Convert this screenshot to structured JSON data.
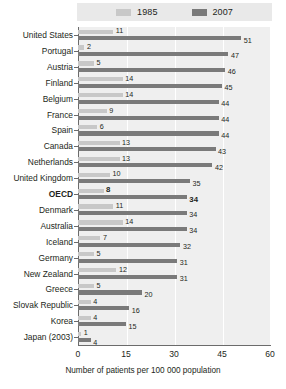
{
  "chart_data": {
    "type": "bar",
    "orientation": "horizontal",
    "title": "",
    "xlabel": "Number of patients per 100 000 population",
    "ylabel": "",
    "xlim": [
      0,
      60
    ],
    "xticks": [
      0,
      15,
      30,
      45,
      60
    ],
    "grid": true,
    "legend_position": "top",
    "categories": [
      "United States",
      "Portugal",
      "Austria",
      "Finland",
      "Belgium",
      "France",
      "Spain",
      "Canada",
      "Netherlands",
      "United Kingdom",
      "OECD",
      "Denmark",
      "Australia",
      "Iceland",
      "Germany",
      "New Zealand",
      "Greece",
      "Slovak Republic",
      "Korea",
      "Japan (2003)"
    ],
    "highlight_category": "OECD",
    "series": [
      {
        "name": "1985",
        "color": "#c8c8c8",
        "values": [
          11,
          2,
          5,
          14,
          14,
          9,
          6,
          13,
          13,
          10,
          8,
          11,
          14,
          7,
          5,
          12,
          5,
          4,
          4,
          1
        ]
      },
      {
        "name": "2007",
        "color": "#7a7a7a",
        "values": [
          51,
          47,
          46,
          45,
          44,
          44,
          44,
          43,
          42,
          35,
          34,
          34,
          34,
          32,
          31,
          31,
          20,
          16,
          15,
          4
        ]
      }
    ]
  },
  "legend": {
    "entries": [
      {
        "label": "1985"
      },
      {
        "label": "2007"
      }
    ]
  },
  "axis": {
    "tick_labels": [
      "0",
      "15",
      "30",
      "45",
      "60"
    ],
    "caption": "Number of patients per 100 000 population"
  }
}
